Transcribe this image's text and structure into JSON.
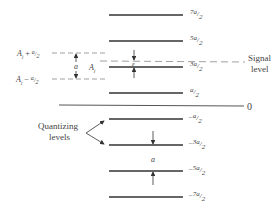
{
  "diagram": {
    "levels": [
      {
        "label_num": "7a",
        "label_den": "2",
        "sign": ""
      },
      {
        "label_num": "5a",
        "label_den": "2",
        "sign": ""
      },
      {
        "label_num": "3a",
        "label_den": "2",
        "sign": ""
      },
      {
        "label_num": "a",
        "label_den": "2",
        "sign": ""
      },
      {
        "label_num": "a",
        "label_den": "2",
        "sign": "−"
      },
      {
        "label_num": "3a",
        "label_den": "2",
        "sign": "−"
      },
      {
        "label_num": "5a",
        "label_den": "2",
        "sign": "−"
      },
      {
        "label_num": "7a",
        "label_den": "2",
        "sign": "−"
      }
    ],
    "zero_label": "0",
    "signal_level_label_1": "Signal",
    "signal_level_label_2": "level",
    "quantizing_label_1": "Quantizing",
    "quantizing_label_2": "levels",
    "upper_bound": {
      "base": "A",
      "sub": "j",
      "op": "+",
      "num": "a",
      "den": "2"
    },
    "lower_bound": {
      "base": "A",
      "sub": "j",
      "op": "−",
      "num": "a",
      "den": "2"
    },
    "interval_label": "a",
    "center_label": {
      "base": "A",
      "sub": "j"
    },
    "error_label": "ε",
    "step_label": "a"
  }
}
